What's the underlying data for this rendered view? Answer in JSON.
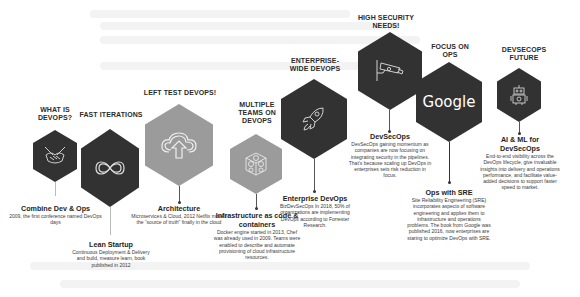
{
  "colors": {
    "dark_hex": "#323232",
    "gray_hex": "#9b9b9b",
    "line": "#555555",
    "background": "#ffffff"
  },
  "stages": [
    {
      "title": "WHAT IS DEVOPS?",
      "icon": "handshake-icon",
      "hex": "dark",
      "heading": "Combine Dev & Ops",
      "body": "2009, the first conference named DevOps days"
    },
    {
      "title": "FAST ITERATIONS",
      "icon": "infinity-icon",
      "hex": "dark",
      "heading": "Lean Startup",
      "body": "Continuous Deployment & Delivery and build, measure learn, book published in 2012"
    },
    {
      "title": "LEFT TEST DEVOPS!",
      "icon": "cloud-upload-icon",
      "hex": "gray",
      "heading": "Architecture",
      "body": "Microservices & Cloud, 2012 Netflix moved the “source of truth” finally in the cloud"
    },
    {
      "title": "MULTIPLE TEAMS ON DEVOPS",
      "icon": "containers-cube-icon",
      "hex": "gray",
      "heading": "Infrastructure as code & containers",
      "body": "Docker engine started in 2013, Chef was already used in 2009. Teams were enabled to describe and automate provisioning of cloud infrastructure resources."
    },
    {
      "title": "ENTERPRISE-WIDE DEVOPS",
      "icon": "rocket-icon",
      "hex": "dark",
      "heading": "Enterprise DevOps",
      "body": "BizDevSecOps In 2018, 50% of organizations are implementing DevOps according to Forrester Research."
    },
    {
      "title": "HIGH SECURITY NEEDS!",
      "icon": "security-camera-icon",
      "hex": "dark",
      "heading": "DevSecOps",
      "body": "DevSecOps gaining momentum as companies are now focusing on integrating security in the pipelines. That’s because scaling up DevOps in enterprises sets risk reduction in focus."
    },
    {
      "title": "FOCUS ON OPS",
      "icon": "google-logo",
      "icon_text": "Google",
      "hex": "dark",
      "heading": "Ops with SRE",
      "body": "Site Reliability Engineering (SRE) incorporates aspects of software engineering and applies them to infrastructure and operations problems. The book from Google was published 2016, now enterprises are staring to optimize DevOps with SRE."
    },
    {
      "title": "DEVSECOPS FUTURE",
      "icon": "robot-icon",
      "hex": "dark",
      "heading": "AI & ML for DevSecOps",
      "body": "End-to-end visibility across the DevOps lifecycle, give invaluable insights into delivery and operations performance, and facilitate value-added decisions to support faster speed to market."
    }
  ]
}
